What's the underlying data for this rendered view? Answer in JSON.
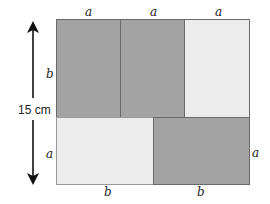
{
  "diagram": {
    "type": "rectangle-partition",
    "colors": {
      "dark": "#a3a3a3",
      "light": "#ececec",
      "border": "#6a6a6a",
      "arrow": "#111111"
    },
    "top_labels": [
      "a",
      "a",
      "a"
    ],
    "left_labels": [
      "b",
      "a"
    ],
    "right_label": "a",
    "bottom_labels": [
      "b",
      "b"
    ],
    "height_label": "15 cm",
    "cells": [
      {
        "name": "top-left",
        "shade": "dark"
      },
      {
        "name": "top-middle",
        "shade": "dark"
      },
      {
        "name": "top-right",
        "shade": "light"
      },
      {
        "name": "bottom-left",
        "shade": "light"
      },
      {
        "name": "bottom-right",
        "shade": "dark"
      }
    ]
  }
}
